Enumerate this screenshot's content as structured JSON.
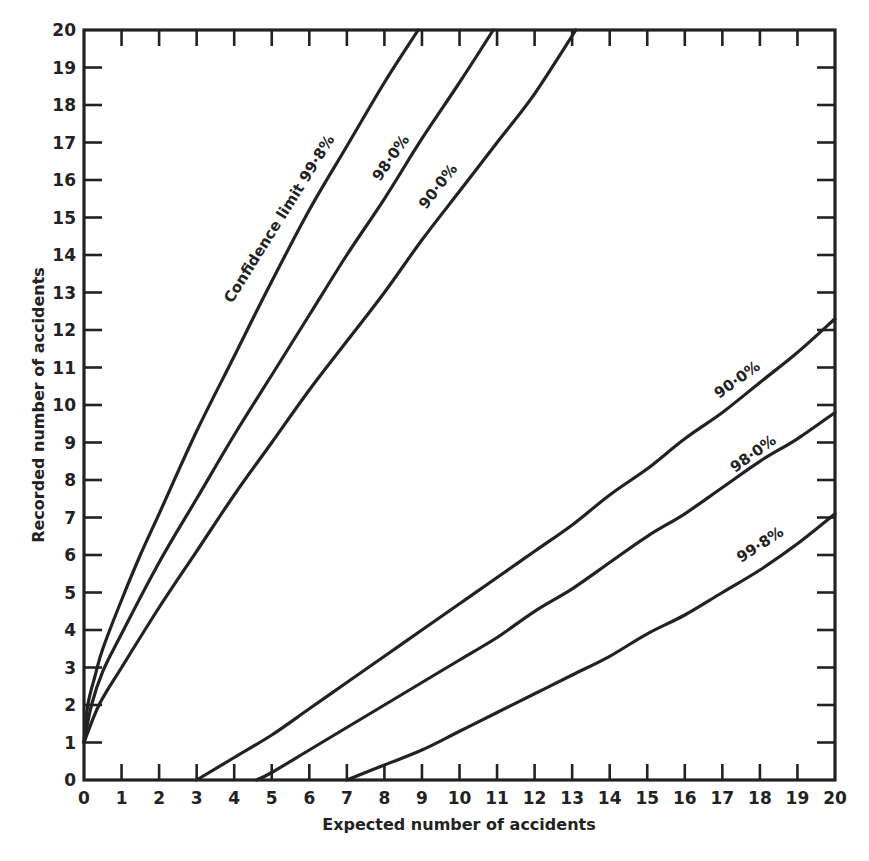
{
  "chart_data": {
    "type": "line",
    "title": "",
    "xlabel": "Expected number of accidents",
    "ylabel": "Recorded number of accidents",
    "xlim": [
      0,
      20
    ],
    "ylim": [
      0,
      20
    ],
    "grid": false,
    "legend": "inline labels on curves",
    "x_ticks": [
      0,
      1,
      2,
      3,
      4,
      5,
      6,
      7,
      8,
      9,
      10,
      11,
      12,
      13,
      14,
      15,
      16,
      17,
      18,
      19,
      20
    ],
    "y_ticks": [
      0,
      1,
      2,
      3,
      4,
      5,
      6,
      7,
      8,
      9,
      10,
      11,
      12,
      13,
      14,
      15,
      16,
      17,
      18,
      19,
      20
    ],
    "series": [
      {
        "name": "Upper confidence limit 99.8%",
        "label": "Confidence limit 99·8%",
        "points": [
          [
            0,
            1
          ],
          [
            0.1,
            2
          ],
          [
            0.3,
            2.8
          ],
          [
            0.5,
            3.5
          ],
          [
            1,
            4.8
          ],
          [
            1.5,
            6
          ],
          [
            2,
            7.1
          ],
          [
            3,
            9.3
          ],
          [
            4,
            11.3
          ],
          [
            5,
            13.3
          ],
          [
            6,
            15.2
          ],
          [
            7,
            16.9
          ],
          [
            8,
            18.6
          ],
          [
            8.9,
            20
          ]
        ]
      },
      {
        "name": "Upper confidence limit 98.0%",
        "label": "98·0%",
        "points": [
          [
            0,
            1
          ],
          [
            0.2,
            2
          ],
          [
            0.5,
            2.9
          ],
          [
            1,
            3.9
          ],
          [
            2,
            5.8
          ],
          [
            3,
            7.5
          ],
          [
            4,
            9.2
          ],
          [
            5,
            10.8
          ],
          [
            6,
            12.4
          ],
          [
            7,
            14
          ],
          [
            8,
            15.5
          ],
          [
            9,
            17.1
          ],
          [
            10,
            18.6
          ],
          [
            10.9,
            20
          ]
        ]
      },
      {
        "name": "Upper confidence limit 90.0%",
        "label": "90·0%",
        "points": [
          [
            0,
            1
          ],
          [
            0.4,
            2
          ],
          [
            1,
            3
          ],
          [
            2,
            4.6
          ],
          [
            3,
            6.1
          ],
          [
            4,
            7.6
          ],
          [
            5,
            9
          ],
          [
            6,
            10.4
          ],
          [
            7,
            11.7
          ],
          [
            8,
            13
          ],
          [
            9,
            14.4
          ],
          [
            10,
            15.7
          ],
          [
            11,
            17
          ],
          [
            12,
            18.3
          ],
          [
            13.1,
            20
          ]
        ]
      },
      {
        "name": "Lower confidence limit 90.0%",
        "label": "90·0%",
        "points": [
          [
            3,
            0
          ],
          [
            4,
            0.6
          ],
          [
            5,
            1.2
          ],
          [
            6,
            1.9
          ],
          [
            7,
            2.6
          ],
          [
            8,
            3.3
          ],
          [
            9,
            4
          ],
          [
            10,
            4.7
          ],
          [
            11,
            5.4
          ],
          [
            12,
            6.1
          ],
          [
            13,
            6.8
          ],
          [
            14,
            7.6
          ],
          [
            15,
            8.3
          ],
          [
            16,
            9.1
          ],
          [
            17,
            9.8
          ],
          [
            18,
            10.6
          ],
          [
            19,
            11.4
          ],
          [
            20,
            12.3
          ]
        ]
      },
      {
        "name": "Lower confidence limit 98.0%",
        "label": "98·0%",
        "points": [
          [
            4.6,
            0
          ],
          [
            5,
            0.2
          ],
          [
            6,
            0.8
          ],
          [
            7,
            1.4
          ],
          [
            8,
            2
          ],
          [
            9,
            2.6
          ],
          [
            10,
            3.2
          ],
          [
            11,
            3.8
          ],
          [
            12,
            4.5
          ],
          [
            13,
            5.1
          ],
          [
            14,
            5.8
          ],
          [
            15,
            6.5
          ],
          [
            16,
            7.1
          ],
          [
            17,
            7.8
          ],
          [
            18,
            8.5
          ],
          [
            19,
            9.1
          ],
          [
            20,
            9.8
          ]
        ]
      },
      {
        "name": "Lower confidence limit 99.8%",
        "label": "99·8%",
        "points": [
          [
            7,
            0
          ],
          [
            8,
            0.4
          ],
          [
            9,
            0.8
          ],
          [
            10,
            1.3
          ],
          [
            11,
            1.8
          ],
          [
            12,
            2.3
          ],
          [
            13,
            2.8
          ],
          [
            14,
            3.3
          ],
          [
            15,
            3.9
          ],
          [
            16,
            4.4
          ],
          [
            17,
            5
          ],
          [
            18,
            5.6
          ],
          [
            19,
            6.3
          ],
          [
            20,
            7.1
          ]
        ]
      }
    ]
  },
  "axes": {
    "x_title": "Expected number of accidents",
    "y_title": "Recorded number of accidents"
  },
  "labels": {
    "upper_998": "Confidence limit 99·8%",
    "upper_980": "98·0%",
    "upper_900": "90·0%",
    "lower_900": "90·0%",
    "lower_980": "98·0%",
    "lower_998": "99·8%"
  }
}
